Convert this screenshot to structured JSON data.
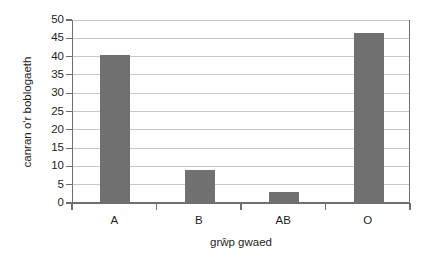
{
  "chart_data": {
    "type": "bar",
    "title": "",
    "xlabel": "grŵp gwaed",
    "ylabel": "canran o'r boblogaeth",
    "categories": [
      "A",
      "B",
      "AB",
      "O"
    ],
    "values": [
      40.5,
      9,
      3,
      46.5
    ],
    "ylim": [
      0,
      50
    ],
    "ytick_values": [
      0,
      5,
      10,
      15,
      20,
      25,
      30,
      35,
      40,
      45,
      50
    ],
    "ytick_labels": [
      "0",
      "5",
      "10",
      "15",
      "20",
      "25",
      "30",
      "35",
      "40",
      "45",
      "50"
    ],
    "grid": true,
    "legend": "none",
    "series": [
      {
        "name": "canran o'r boblogaeth",
        "values": [
          40.5,
          9,
          3,
          46.5
        ]
      }
    ]
  },
  "style": {
    "bar_color": "#707070",
    "grid_color": "#c9c9c9",
    "axis_color": "#6f6f6f",
    "text_color": "#231f20",
    "background": "#ffffff"
  }
}
